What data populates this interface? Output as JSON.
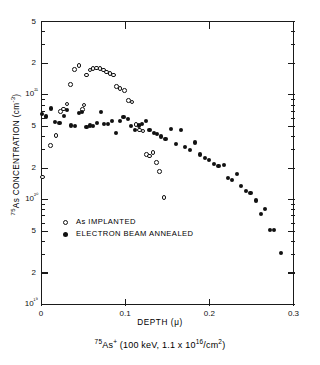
{
  "chart_data": {
    "type": "scatter",
    "title": "",
    "caption": "⁷⁵As⁺ (100 keV, 1.1 x 10¹⁶/cm²)",
    "xlabel": "DEPTH (μ)",
    "ylabel": "⁷⁵As CONCENTRATION (cm⁻³)",
    "xlim": [
      0,
      0.3
    ],
    "ylim": [
      1e+19,
      5e+21
    ],
    "yscale": "log",
    "xscale": "linear",
    "grid": false,
    "legend_position": "center-left",
    "xticks": [
      0,
      0.1,
      0.2,
      0.3
    ],
    "xticklabels": [
      "0",
      "0.1",
      "0.2",
      "0.3"
    ],
    "yticks": [
      1e+19,
      2e+19,
      5e+19,
      1e+20,
      2e+20,
      5e+20,
      1e+21,
      2e+21,
      5e+21
    ],
    "yticklabels": [
      "10¹⁹",
      "2",
      "5",
      "10²⁰",
      "2",
      "5",
      "10²¹",
      "2",
      "5"
    ],
    "series": [
      {
        "name": "As IMPLANTED",
        "marker": "open-circle",
        "color": "#111111",
        "points": [
          [
            0.002,
            1.65e+20
          ],
          [
            0.011,
            3.3e+20
          ],
          [
            0.018,
            4.1e+20
          ],
          [
            0.023,
            6.9e+20
          ],
          [
            0.027,
            7.3e+20
          ],
          [
            0.031,
            8.2e+20
          ],
          [
            0.035,
            1.25e+21
          ],
          [
            0.04,
            1.75e+21
          ],
          [
            0.045,
            1.9e+21
          ],
          [
            0.049,
            7.2e+20
          ],
          [
            0.051,
            8e+20
          ],
          [
            0.054,
            1.55e+21
          ],
          [
            0.058,
            1.72e+21
          ],
          [
            0.062,
            1.78e+21
          ],
          [
            0.066,
            1.8e+21
          ],
          [
            0.07,
            1.78e+21
          ],
          [
            0.074,
            1.72e+21
          ],
          [
            0.078,
            1.65e+21
          ],
          [
            0.082,
            1.6e+21
          ],
          [
            0.086,
            1.55e+21
          ],
          [
            0.09,
            1.2e+21
          ],
          [
            0.094,
            1.15e+21
          ],
          [
            0.099,
            1.1e+21
          ],
          [
            0.104,
            8.8e+20
          ],
          [
            0.108,
            8.5e+20
          ],
          [
            0.113,
            5.2e+20
          ],
          [
            0.117,
            4.6e+20
          ],
          [
            0.121,
            4.5e+20
          ],
          [
            0.125,
            2.7e+20
          ],
          [
            0.129,
            2.6e+20
          ],
          [
            0.133,
            2.8e+20
          ],
          [
            0.137,
            2.25e+20
          ],
          [
            0.141,
            1.85e+20
          ],
          [
            0.146,
            1.05e+20
          ]
        ]
      },
      {
        "name": "ELECTRON BEAM ANNEALED",
        "marker": "filled-circle",
        "color": "#111111",
        "points": [
          [
            0.001,
            6.6e+20
          ],
          [
            0.006,
            6.2e+20
          ],
          [
            0.012,
            7.4e+20
          ],
          [
            0.017,
            5.5e+20
          ],
          [
            0.022,
            5.4e+20
          ],
          [
            0.027,
            6.3e+20
          ],
          [
            0.031,
            7.1e+20
          ],
          [
            0.036,
            5.1e+20
          ],
          [
            0.04,
            5e+20
          ],
          [
            0.045,
            6.7e+20
          ],
          [
            0.049,
            6.9e+20
          ],
          [
            0.054,
            4.9e+20
          ],
          [
            0.058,
            5.1e+20
          ],
          [
            0.062,
            5e+20
          ],
          [
            0.067,
            5.4e+20
          ],
          [
            0.071,
            6.9e+20
          ],
          [
            0.075,
            5.3e+20
          ],
          [
            0.08,
            5.3e+20
          ],
          [
            0.084,
            5.6e+20
          ],
          [
            0.089,
            4.3e+20
          ],
          [
            0.094,
            5.6e+20
          ],
          [
            0.098,
            6.1e+20
          ],
          [
            0.103,
            5.9e+20
          ],
          [
            0.107,
            5e+20
          ],
          [
            0.112,
            4.6e+20
          ],
          [
            0.116,
            5.1e+20
          ],
          [
            0.12,
            5.3e+20
          ],
          [
            0.125,
            5.6e+20
          ],
          [
            0.129,
            4.6e+20
          ],
          [
            0.134,
            4.3e+20
          ],
          [
            0.138,
            4.2e+20
          ],
          [
            0.143,
            4e+20
          ],
          [
            0.148,
            3.8e+20
          ],
          [
            0.154,
            4.7e+20
          ],
          [
            0.16,
            3.4e+20
          ],
          [
            0.166,
            4.6e+20
          ],
          [
            0.171,
            3.2e+20
          ],
          [
            0.177,
            3e+20
          ],
          [
            0.183,
            3.5e+20
          ],
          [
            0.189,
            2.7e+20
          ],
          [
            0.195,
            2.5e+20
          ],
          [
            0.2,
            2.4e+20
          ],
          [
            0.206,
            2.2e+20
          ],
          [
            0.211,
            2.1e+20
          ],
          [
            0.217,
            2.15e+20
          ],
          [
            0.222,
            1.6e+20
          ],
          [
            0.227,
            1.55e+20
          ],
          [
            0.233,
            1.75e+20
          ],
          [
            0.238,
            1.35e+20
          ],
          [
            0.244,
            1.2e+20
          ],
          [
            0.249,
            1.15e+20
          ],
          [
            0.255,
            9.8e+19
          ],
          [
            0.261,
            7.3e+19
          ],
          [
            0.266,
            8.2e+19
          ],
          [
            0.272,
            5.1e+19
          ],
          [
            0.277,
            5.1e+19
          ],
          [
            0.285,
            3.1e+19
          ]
        ]
      }
    ]
  }
}
